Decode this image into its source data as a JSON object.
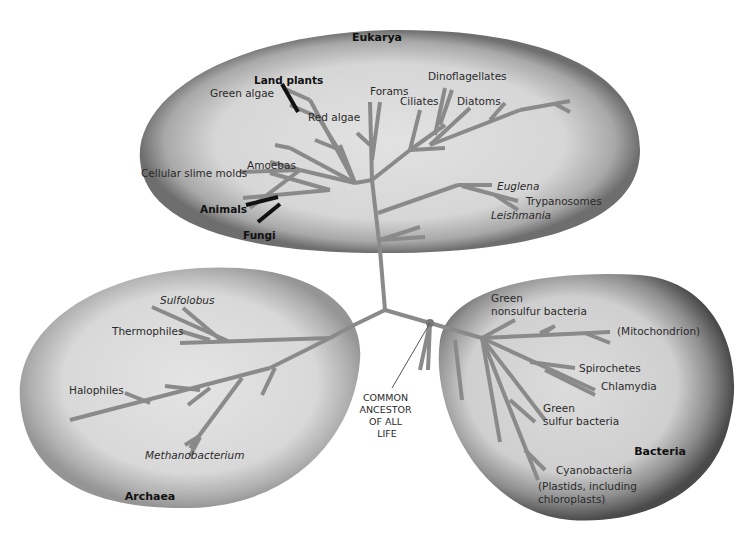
{
  "domains": {
    "eukarya": {
      "label": "Eukarya",
      "groups": [
        {
          "label": "Land plants",
          "emphasis": "bold"
        },
        {
          "label": "Green algae"
        },
        {
          "label": "Red algae"
        },
        {
          "label": "Forams"
        },
        {
          "label": "Dinoflagellates"
        },
        {
          "label": "Ciliates"
        },
        {
          "label": "Diatoms"
        },
        {
          "label": "Amoebas"
        },
        {
          "label": "Cellular slime molds"
        },
        {
          "label": "Animals",
          "emphasis": "bold"
        },
        {
          "label": "Fungi",
          "emphasis": "bold"
        },
        {
          "label": "Euglena",
          "emphasis": "italic"
        },
        {
          "label": "Trypanosomes"
        },
        {
          "label": "Leishmania",
          "emphasis": "italic"
        }
      ]
    },
    "archaea": {
      "label": "Archaea",
      "groups": [
        {
          "label": "Sulfolobus",
          "emphasis": "italic"
        },
        {
          "label": "Thermophiles"
        },
        {
          "label": "Halophiles"
        },
        {
          "label": "Methanobacterium",
          "emphasis": "italic"
        }
      ]
    },
    "bacteria": {
      "label": "Bacteria",
      "groups": [
        {
          "label": "Green",
          "line2": "nonsulfur bacteria"
        },
        {
          "label": "(Mitochondrion)"
        },
        {
          "label": "Spirochetes"
        },
        {
          "label": "Chlamydia"
        },
        {
          "label": "Green",
          "line2": "sulfur bacteria"
        },
        {
          "label": "Cyanobacteria"
        },
        {
          "label": "(Plastids, including",
          "line2": "chloroplasts)"
        }
      ]
    }
  },
  "root": {
    "lines": [
      "COMMON",
      "ANCESTOR",
      "OF ALL",
      "LIFE"
    ]
  },
  "colors": {
    "branch": "#8a8a8a",
    "highlight_branch": "#111111",
    "blob_fill": "#d8d8d8",
    "blob_edge": "#7a7a7a"
  }
}
